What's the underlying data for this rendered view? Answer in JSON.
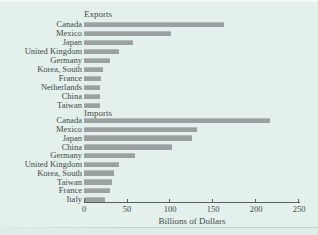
{
  "colors": {
    "background": "#e4f0ec",
    "bar": "#9ba1a0",
    "bar_highlight": "#b5bab8",
    "text": "#434a45",
    "axis": "#59605b"
  },
  "chart_data": {
    "type": "bar",
    "orientation": "horizontal",
    "title": "",
    "xlabel": "Billions of Dollars",
    "ylabel": "",
    "xlim": [
      0,
      250
    ],
    "xticks": [
      0,
      50,
      100,
      150,
      200,
      250
    ],
    "grid": false,
    "legend": "none",
    "groups": [
      {
        "title": "Exports",
        "categories": [
          "Canada",
          "Mexico",
          "Japan",
          "United Kingdom",
          "Germany",
          "Korea, South",
          "France",
          "Netherlands",
          "China",
          "Taiwan"
        ],
        "values": [
          163,
          101,
          57,
          41,
          30,
          22,
          20,
          19,
          19,
          18
        ]
      },
      {
        "title": "Imports",
        "categories": [
          "Canada",
          "Mexico",
          "Japan",
          "China",
          "Germany",
          "United Kingdom",
          "Korea, South",
          "Taiwan",
          "France",
          "Italy"
        ],
        "values": [
          216,
          131,
          126,
          102,
          59,
          41,
          35,
          33,
          30,
          24
        ]
      }
    ]
  }
}
